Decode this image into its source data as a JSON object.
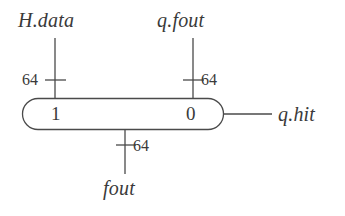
{
  "figure": {
    "type": "block-diagram",
    "background_color": "#ffffff",
    "stroke_color": "#4a4a4a"
  },
  "block": {
    "shape": "stadium",
    "left_cell_label": "1",
    "right_cell_label": "0"
  },
  "ports": {
    "top_left": {
      "signal_label": "H.data",
      "width_label": "64",
      "direction": "input"
    },
    "top_right": {
      "signal_label": "q.fout",
      "width_label": "64",
      "direction": "input"
    },
    "bottom": {
      "signal_label": "fout",
      "width_label": "64",
      "direction": "output"
    },
    "right": {
      "signal_label": "q.hit",
      "width_label": "",
      "direction": "output"
    }
  }
}
